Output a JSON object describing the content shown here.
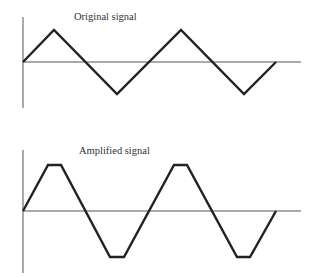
{
  "diagram": {
    "panels": [
      {
        "title": "Original signal",
        "type": "triangle-wave",
        "axis": {
          "x": 23,
          "y_top": 17,
          "y_bottom": 108,
          "baseline_y": 62,
          "baseline_x_end": 301
        },
        "points": "23,62 54,30 117,94 181,30 244,94 276,62"
      },
      {
        "title": "Amplified signal",
        "type": "clipped-triangle-wave",
        "axis": {
          "x": 23,
          "y_top": 150,
          "y_bottom": 273,
          "baseline_y": 211,
          "baseline_x_end": 301
        },
        "points": "23,211 48,165 61,165 110,257 124,257 174,165 187,165 237,257 250,257 276,211"
      }
    ],
    "colors": {
      "signal": "#222222",
      "axis": "#555555",
      "text": "#333333"
    }
  }
}
